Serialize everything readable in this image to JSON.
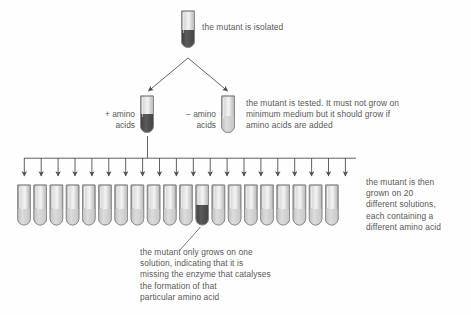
{
  "diagram": {
    "background_color": "#fefefe",
    "ink_color": "#585858",
    "tube_outline_color": "#8a8a8a",
    "growth_color": "#4a4a4a",
    "no_growth_color": "#c9c9c9"
  },
  "steps": {
    "isolate": {
      "caption": "the mutant is isolated",
      "tube": {
        "name": "mutant-tube",
        "content": "growth",
        "x": 188,
        "y": 10
      }
    },
    "test": {
      "caption": "the mutant is tested. It must not grow on\nminimum medium but it should grow if\namino acids are added",
      "tubes": [
        {
          "name": "plus-amino-acids-tube",
          "label": "+ amino\nacids",
          "content": "growth",
          "x": 147,
          "y": 95
        },
        {
          "name": "minus-amino-acids-tube",
          "label": "− amino\nacids",
          "content": "no-growth",
          "x": 228,
          "y": 95
        }
      ]
    },
    "screen": {
      "caption": "the mutant is then\ngrown on 20\ndifferent solutions,\neach containing a\ndifferent amino acid",
      "conclusion": "the mutant only grows on one\nsolution, indicating that it is\nmissing the enzyme that catalyses\nthe formation of that\nparticular amino acid",
      "tube_count": 20,
      "growth_tube_index": 12,
      "row_first_x": 24,
      "row_spacing": 16.2,
      "row_top_y": 185,
      "manifold_y": 158,
      "arrow_tip_y": 180
    }
  },
  "chart_data": {
    "type": "table",
    "categories": [
      "1",
      "2",
      "3",
      "4",
      "5",
      "6",
      "7",
      "8",
      "9",
      "10",
      "11",
      "12",
      "13",
      "14",
      "15",
      "16",
      "17",
      "18",
      "19",
      "20"
    ],
    "values": [
      0,
      0,
      0,
      0,
      0,
      0,
      0,
      0,
      0,
      0,
      0,
      1,
      0,
      0,
      0,
      0,
      0,
      0,
      0,
      0
    ],
    "xlabel": "solution (different amino acid)",
    "ylabel": "growth (1 = grows, 0 = no growth)",
    "ylim": [
      0,
      1
    ],
    "legend": [
      "growth",
      "no growth"
    ],
    "annotations": [
      "only solution 12 supports growth"
    ]
  }
}
